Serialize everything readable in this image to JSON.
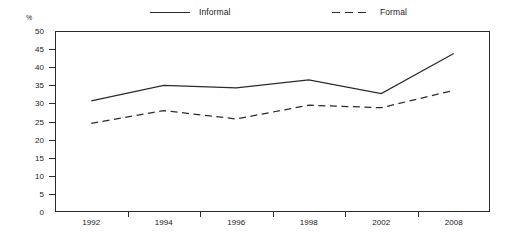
{
  "chart_data": {
    "type": "line",
    "title": "",
    "subtitle": "",
    "xlabel": "",
    "ylabel": "%",
    "unit_label": "%",
    "categories": [
      "1992",
      "1994",
      "1996",
      "1998",
      "2002",
      "2008"
    ],
    "ylim": [
      0,
      50
    ],
    "ytick_step": 5,
    "yticks": [
      0,
      5,
      10,
      15,
      20,
      25,
      30,
      35,
      40,
      45,
      50
    ],
    "ytick_labels": [
      "0",
      "5",
      "10",
      "15",
      "20",
      "25",
      "30",
      "35",
      "40",
      "45",
      "50"
    ],
    "grid": false,
    "legend_position": "top",
    "series": [
      {
        "name": "Informal",
        "style": "solid",
        "color": "#2b2b2b",
        "values": [
          30.7,
          35.0,
          34.3,
          36.5,
          32.7,
          43.8
        ]
      },
      {
        "name": "Formal",
        "style": "dashed",
        "color": "#2b2b2b",
        "values": [
          24.5,
          28.0,
          25.7,
          29.5,
          28.8,
          33.6
        ]
      }
    ],
    "annotations": []
  },
  "legend": {
    "items": [
      {
        "label": "Informal",
        "style": "solid"
      },
      {
        "label": "Formal",
        "style": "dashed"
      }
    ]
  },
  "colors": {
    "line": "#2b2b2b",
    "axis": "#2b2b2b",
    "text": "#1a1a1a",
    "background": "#ffffff"
  }
}
